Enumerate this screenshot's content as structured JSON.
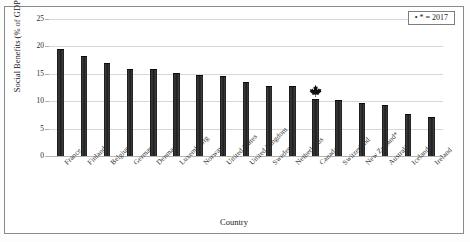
{
  "figure": {
    "legend_label": "* = 2017",
    "legend_marker": "asterisk-marker",
    "canada_marker": "maple-leaf-icon"
  },
  "chart_data": {
    "type": "bar",
    "title": "",
    "xlabel": "Country",
    "ylabel": "Social Benefits (% of GDP)",
    "ylim": [
      0,
      25
    ],
    "yticks": [
      0,
      5,
      10,
      15,
      20,
      25
    ],
    "ytick_labels": [
      "0",
      "5",
      "10",
      "15",
      "20",
      "25"
    ],
    "grid": true,
    "legend_position": "top-right",
    "bar_color": "#262626",
    "categories": [
      "France",
      "Finland",
      "Belgium",
      "Germany",
      "Denmark",
      "Luxembourg",
      "Norway",
      "United States",
      "United Kingdom",
      "Sweden",
      "Netherlands",
      "Canada",
      "Switzerland",
      "New Zealand*",
      "Australia",
      "Iceland",
      "Ireland"
    ],
    "values": [
      19.6,
      18.2,
      17.0,
      15.9,
      15.8,
      15.1,
      14.8,
      14.6,
      13.5,
      12.8,
      12.7,
      10.4,
      10.3,
      9.6,
      9.4,
      7.7,
      7.1
    ],
    "highlight_category": "Canada",
    "annotations": [
      {
        "category": "Canada",
        "marker": "maple-leaf",
        "text": ""
      }
    ]
  }
}
